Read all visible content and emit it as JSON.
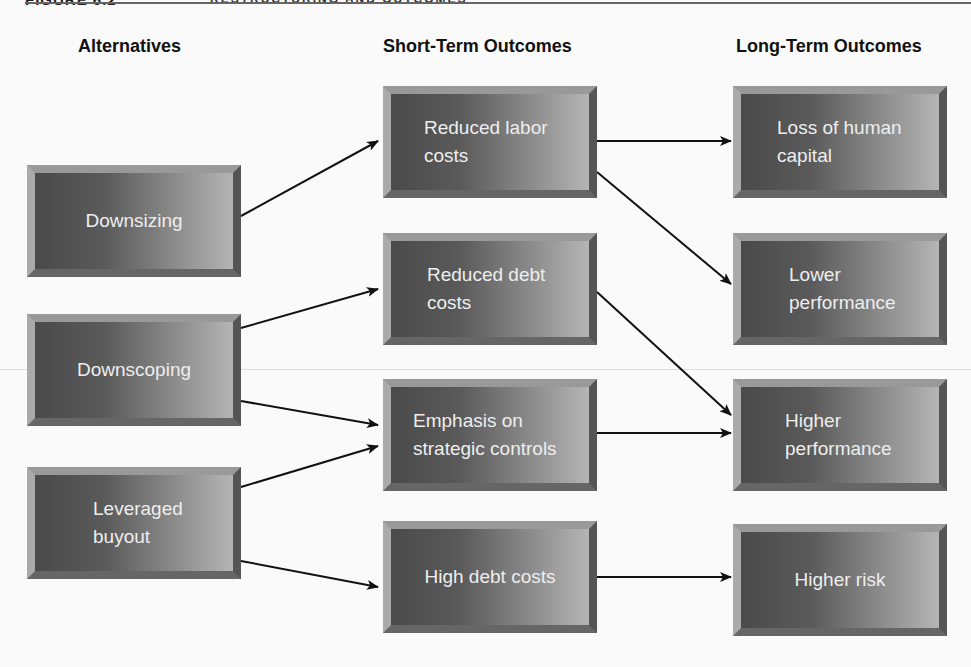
{
  "header": {
    "figure_label": "FIGURE 6.2",
    "figure_title": "RESTRUCTURING AND OUTCOMES"
  },
  "columns": [
    {
      "label": "Alternatives"
    },
    {
      "label": "Short-Term Outcomes"
    },
    {
      "label": "Long-Term Outcomes"
    }
  ],
  "alternatives": [
    {
      "id": "downsizing",
      "label": "Downsizing"
    },
    {
      "id": "downscoping",
      "label": "Downscoping"
    },
    {
      "id": "lbo",
      "label": "Leveraged\nbuyout"
    }
  ],
  "short_term": [
    {
      "id": "rlc",
      "label": "Reduced labor\ncosts"
    },
    {
      "id": "rdc",
      "label": "Reduced debt\ncosts"
    },
    {
      "id": "esc",
      "label": "Emphasis on\nstrategic controls"
    },
    {
      "id": "hdc",
      "label": "High debt costs"
    }
  ],
  "long_term": [
    {
      "id": "lhc",
      "label": "Loss of human\ncapital"
    },
    {
      "id": "lp",
      "label": "Lower\nperformance"
    },
    {
      "id": "hp",
      "label": "Higher\nperformance"
    },
    {
      "id": "hr",
      "label": "Higher risk"
    }
  ],
  "edges": [
    [
      "downsizing",
      "rlc"
    ],
    [
      "downscoping",
      "rdc"
    ],
    [
      "downscoping",
      "esc"
    ],
    [
      "lbo",
      "esc"
    ],
    [
      "lbo",
      "hdc"
    ],
    [
      "rlc",
      "lhc"
    ],
    [
      "rlc",
      "lp"
    ],
    [
      "rdc",
      "hp"
    ],
    [
      "esc",
      "hp"
    ],
    [
      "hdc",
      "hr"
    ]
  ]
}
